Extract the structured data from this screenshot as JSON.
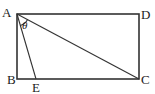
{
  "diagram": {
    "type": "geometry",
    "shape": "rectangle",
    "points": {
      "A": {
        "label": "A",
        "x": 17,
        "y": 14
      },
      "B": {
        "label": "B",
        "x": 17,
        "y": 79
      },
      "C": {
        "label": "C",
        "x": 139,
        "y": 79
      },
      "D": {
        "label": "D",
        "x": 139,
        "y": 14
      },
      "E": {
        "label": "E",
        "x": 36,
        "y": 79
      }
    },
    "segments": [
      "AB",
      "BC",
      "CD",
      "DA",
      "AC",
      "AE"
    ],
    "angle": {
      "label": "θ",
      "between": [
        "AE",
        "AC"
      ],
      "vertex": "A"
    }
  }
}
